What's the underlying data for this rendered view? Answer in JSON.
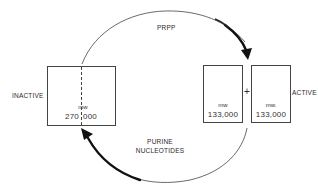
{
  "diagram": {
    "type": "enzyme-state-cycle",
    "labels": {
      "inactive": "INACTIVE",
      "active": "ACTIVE",
      "top_arrow": "PRPP",
      "bottom_arrow_line1": "PURINE",
      "bottom_arrow_line2": "NUCLEOTIDES",
      "plus": "+"
    },
    "inactive_box": {
      "mw_label": "mw",
      "mw_left": "270",
      "mw_right": "000",
      "mw_value": "270,000"
    },
    "active_boxes": [
      {
        "mw_label": "mw",
        "mw_value": "133,000"
      },
      {
        "mw_label": "mw.",
        "mw_value": "133,000"
      }
    ],
    "arrows": [
      {
        "from": "inactive",
        "to": "active",
        "label": "PRPP"
      },
      {
        "from": "active",
        "to": "inactive",
        "label": "PURINE NUCLEOTIDES"
      }
    ],
    "colors": {
      "line": "#444444",
      "arrow": "#111111",
      "background": "#ffffff"
    }
  }
}
